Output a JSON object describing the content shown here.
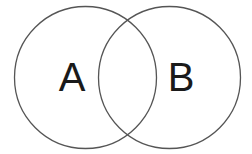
{
  "diagram": {
    "type": "venn",
    "sets": [
      {
        "label": "A",
        "cx": 85.5,
        "cy": 77.5,
        "r": 71
      },
      {
        "label": "B",
        "cx": 169.5,
        "cy": 77.5,
        "r": 71
      }
    ],
    "stroke_color": "#555555",
    "text_color": "#1a1a1a",
    "background": "#ffffff"
  }
}
